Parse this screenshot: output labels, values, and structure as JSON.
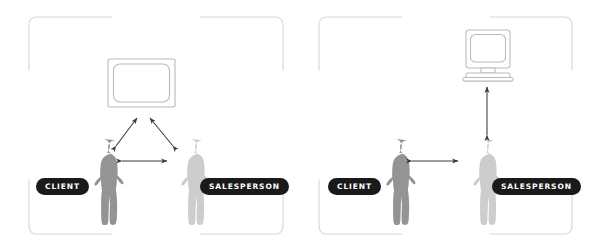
{
  "diagram": {
    "background_color": "#ffffff",
    "frame_color": "#d8d8d8",
    "label_background": "#1a1a1a",
    "label_text_color": "#ffffff",
    "arrow_color": "#3b3b3b",
    "figure_client_color": "#9a9a9a",
    "figure_salesperson_color": "#d2d2d2",
    "panels": [
      {
        "id": "left-panel",
        "name": "shared-screen-configuration",
        "display_device": "television-screen",
        "actors": [
          {
            "role": "client",
            "label": "CLIENT",
            "shade": "#9a9a9a"
          },
          {
            "role": "salesperson",
            "label": "SALESPERSON",
            "shade": "#d2d2d2"
          }
        ],
        "connections": [
          {
            "from": "client",
            "to": "screen",
            "type": "double-arrow"
          },
          {
            "from": "salesperson",
            "to": "screen",
            "type": "double-arrow"
          },
          {
            "from": "client",
            "to": "salesperson",
            "type": "double-arrow"
          }
        ]
      },
      {
        "id": "right-panel",
        "name": "salesperson-only-screen-configuration",
        "display_device": "desktop-computer-monitor",
        "actors": [
          {
            "role": "client",
            "label": "CLIENT",
            "shade": "#9a9a9a"
          },
          {
            "role": "salesperson",
            "label": "SALESPERSON",
            "shade": "#d2d2d2"
          }
        ],
        "connections": [
          {
            "from": "salesperson",
            "to": "monitor",
            "type": "double-arrow"
          },
          {
            "from": "client",
            "to": "salesperson",
            "type": "double-arrow"
          }
        ]
      }
    ]
  },
  "labels": {
    "client": "CLIENT",
    "salesperson": "SALESPERSON"
  }
}
